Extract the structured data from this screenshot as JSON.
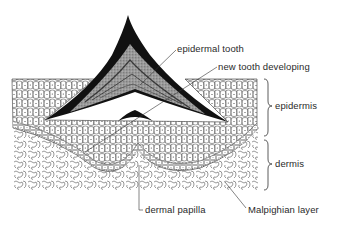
{
  "figure": {
    "labels": {
      "epidermal_tooth": "epidermal tooth",
      "new_tooth": "new tooth developing",
      "epidermis": "epidermis",
      "dermis": "dermis",
      "dermal_papilla": "dermal papilla",
      "malpighian_layer": "Malpighian layer"
    },
    "colors": {
      "ink": "#1a1a1a",
      "tooth_fill": "#111111",
      "tooth_core": "#8a8a8a",
      "cell_line": "#555555",
      "paper": "#ffffff"
    }
  }
}
